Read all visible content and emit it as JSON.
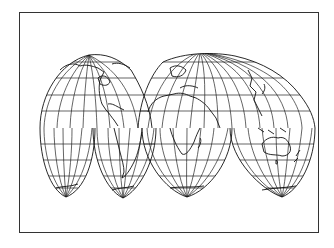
{
  "map": {
    "projection": "Interrupted Goode Homolosine",
    "frame_color": "#333333",
    "line_color": "#111111",
    "background": "#ffffff",
    "lobes": [
      {
        "name": "north-america",
        "hemisphere": "north"
      },
      {
        "name": "eurasia-africa-north",
        "hemisphere": "north"
      },
      {
        "name": "south-pacific",
        "hemisphere": "south"
      },
      {
        "name": "south-america",
        "hemisphere": "south"
      },
      {
        "name": "africa-south",
        "hemisphere": "south"
      },
      {
        "name": "australia-oceania",
        "hemisphere": "south"
      }
    ],
    "graticule_spacing_deg": 15
  }
}
